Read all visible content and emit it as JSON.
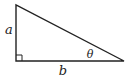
{
  "diagram": {
    "type": "right-triangle",
    "vertices": {
      "top": [
        16,
        5
      ],
      "right_angle": [
        16,
        61
      ],
      "acute": [
        124,
        61
      ]
    },
    "labels": {
      "vertical_leg": "a",
      "horizontal_leg": "b",
      "angle": "θ"
    },
    "right_angle_marker": true,
    "colors": {
      "stroke": "#222222",
      "background": "#ffffff"
    }
  }
}
